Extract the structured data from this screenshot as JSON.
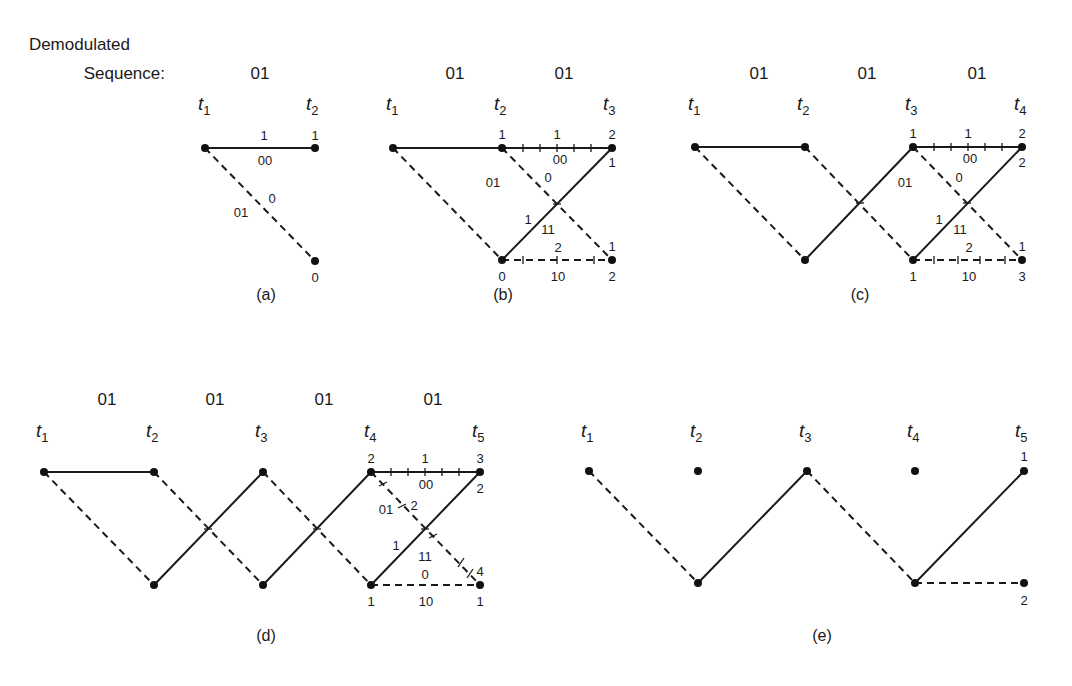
{
  "header": {
    "line1": "Demodulated",
    "line2": "Sequence:"
  },
  "time_label_prefix": "t",
  "panels": {
    "a": {
      "caption": "(a)",
      "sequence": [
        "01"
      ],
      "times": [
        "1",
        "2"
      ],
      "upper_metric_label": "1",
      "upper_branch_label": "00",
      "lower_branch_label": "01",
      "lower_metric_label": "0",
      "upper_end": "1",
      "lower_end": "0"
    },
    "b": {
      "caption": "(b)",
      "sequence": [
        "01",
        "01"
      ],
      "times": [
        "1",
        "2",
        "3"
      ],
      "t2_upper": "1",
      "t2_lower": "0",
      "branch_00_metric": "1",
      "branch_00_label": "00",
      "branch_01_label": "01",
      "branch_01_metric": "0",
      "branch_11_metric": "1",
      "branch_11_label": "11",
      "branch_10_metric": "2",
      "branch_10_label": "10",
      "t3_upper_top": "2",
      "t3_upper_bottom": "1",
      "t3_lower_top": "1",
      "t3_lower_bottom": "2"
    },
    "c": {
      "caption": "(c)",
      "sequence": [
        "01",
        "01",
        "01"
      ],
      "times": [
        "1",
        "2",
        "3",
        "4"
      ],
      "t3_upper": "1",
      "t3_lower": "1",
      "branch_00_metric": "1",
      "branch_00_label": "00",
      "branch_01_label": "01",
      "branch_01_metric": "0",
      "branch_11_metric": "1",
      "branch_11_label": "11",
      "branch_10_metric": "2",
      "branch_10_label": "10",
      "t4_upper_top": "2",
      "t4_upper_bottom": "2",
      "t4_lower_top": "1",
      "t4_lower_bottom": "3"
    },
    "d": {
      "caption": "(d)",
      "sequence": [
        "01",
        "01",
        "01",
        "01"
      ],
      "times": [
        "1",
        "2",
        "3",
        "4",
        "5"
      ],
      "t4_upper": "2",
      "t4_lower": "1",
      "branch_00_metric": "1",
      "branch_00_label": "00",
      "branch_01_label": "01",
      "branch_01_metric": "2",
      "branch_11_metric": "1",
      "branch_11_label": "11",
      "branch_10_metric": "0",
      "branch_10_label": "10",
      "t5_upper_top": "3",
      "t5_upper_bottom": "2",
      "t5_lower_top": "4",
      "t5_lower_bottom": "1"
    },
    "e": {
      "caption": "(e)",
      "times": [
        "1",
        "2",
        "3",
        "4",
        "5"
      ],
      "t5_upper": "1",
      "t5_lower": "2"
    }
  }
}
